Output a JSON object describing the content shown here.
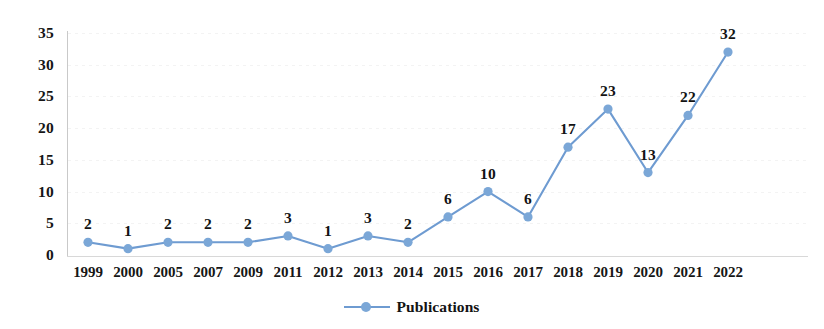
{
  "chart_data": {
    "type": "line",
    "title": "",
    "xlabel": "",
    "ylabel": "",
    "categories": [
      "1999",
      "2000",
      "2005",
      "2007",
      "2009",
      "2011",
      "2012",
      "2013",
      "2014",
      "2015",
      "2016",
      "2017",
      "2018",
      "2019",
      "2020",
      "2021",
      "2022"
    ],
    "series": [
      {
        "name": "Publications",
        "values": [
          2,
          1,
          2,
          2,
          2,
          3,
          1,
          3,
          2,
          6,
          10,
          6,
          17,
          23,
          13,
          22,
          32
        ],
        "color": "#6E9BD1",
        "marker_color": "#7BA7D7"
      }
    ],
    "ylim": [
      0,
      35
    ],
    "y_ticks": [
      "0",
      "5",
      "10",
      "15",
      "20",
      "25",
      "30",
      "35"
    ],
    "data_labels": [
      "2",
      "1",
      "2",
      "2",
      "2",
      "3",
      "1",
      "3",
      "2",
      "6",
      "10",
      "6",
      "17",
      "23",
      "13",
      "22",
      "32"
    ],
    "grid": true,
    "legend_position": "bottom"
  },
  "legend": {
    "entries": [
      {
        "label": "Publications",
        "marker": "line-circle-marker"
      }
    ]
  },
  "colors": {
    "line": "#6E9BD1",
    "marker": "#7BA7D7",
    "text": "#131313",
    "axis": "#c9c9c9",
    "grid": "#f3f3f3",
    "background": "#ffffff"
  }
}
